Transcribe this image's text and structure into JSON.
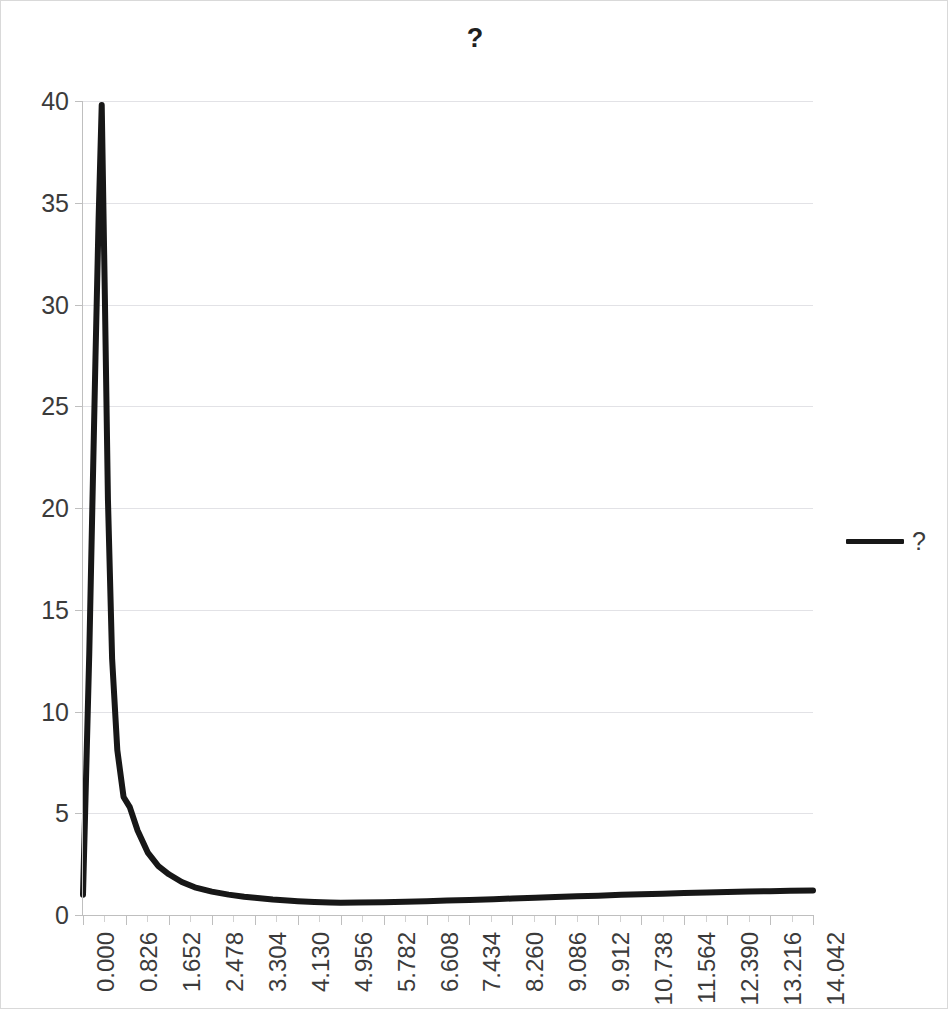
{
  "chart_data": {
    "type": "line",
    "title": "?",
    "xlabel": "",
    "ylabel": "",
    "xlim": [
      0.0,
      14.042
    ],
    "ylim": [
      0,
      40
    ],
    "grid": true,
    "legend_position": "right",
    "legend": [
      "?"
    ],
    "series_color": "#171717",
    "y_ticks": [
      0,
      5,
      10,
      15,
      20,
      25,
      30,
      35,
      40
    ],
    "y_tick_labels": [
      "0",
      "5",
      "10",
      "15",
      "20",
      "25",
      "30",
      "35",
      "40"
    ],
    "x_tick_labels": [
      "0.000",
      "0.826",
      "1.652",
      "2.478",
      "3.304",
      "4.130",
      "4.956",
      "5.782",
      "6.608",
      "7.434",
      "8.260",
      "9.086",
      "9.912",
      "10.738",
      "11.564",
      "12.390",
      "13.216",
      "14.042"
    ],
    "x_tick_values": [
      0.0,
      0.826,
      1.652,
      2.478,
      3.304,
      4.13,
      4.956,
      5.782,
      6.608,
      7.434,
      8.26,
      9.086,
      9.912,
      10.738,
      11.564,
      12.39,
      13.216,
      14.042
    ],
    "x_minor_per_major": 2,
    "series": [
      {
        "name": "?",
        "x": [
          0.0,
          0.12,
          0.24,
          0.3,
          0.36,
          0.42,
          0.48,
          0.56,
          0.66,
          0.78,
          0.9,
          1.05,
          1.25,
          1.45,
          1.652,
          1.9,
          2.15,
          2.478,
          2.8,
          3.1,
          3.304,
          3.65,
          4.0,
          4.13,
          4.45,
          4.75,
          4.956,
          5.3,
          5.782,
          6.2,
          6.608,
          7.0,
          7.434,
          7.9,
          8.26,
          8.7,
          9.086,
          9.5,
          9.912,
          10.35,
          10.738,
          11.15,
          11.564,
          12.0,
          12.39,
          12.8,
          13.216,
          13.6,
          14.042
        ],
        "y": [
          1.0,
          12.8,
          27.4,
          34.2,
          39.8,
          30.5,
          20.4,
          12.6,
          8.1,
          5.8,
          5.3,
          4.15,
          3.05,
          2.4,
          2.0,
          1.62,
          1.36,
          1.15,
          1.0,
          0.9,
          0.85,
          0.76,
          0.7,
          0.68,
          0.64,
          0.61,
          0.6,
          0.61,
          0.63,
          0.65,
          0.68,
          0.71,
          0.74,
          0.78,
          0.81,
          0.85,
          0.88,
          0.92,
          0.95,
          0.99,
          1.02,
          1.05,
          1.08,
          1.11,
          1.13,
          1.15,
          1.17,
          1.19,
          1.21
        ]
      }
    ],
    "peak": {
      "x": 0.36,
      "y": 39.8
    },
    "minimum": {
      "x": 4.956,
      "y": 0.6
    },
    "start_value": 1.0,
    "end_value": 1.21
  }
}
